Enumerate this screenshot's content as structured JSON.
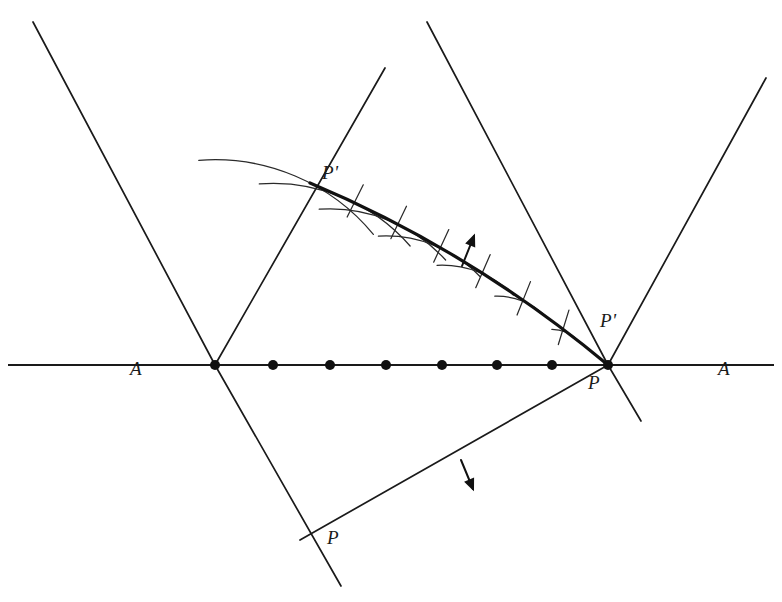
{
  "figure": {
    "width": 782,
    "height": 602,
    "background_color": "#ffffff",
    "stroke_color": "#1a1a1a"
  },
  "labels": {
    "axis_left": "A",
    "axis_right": "A",
    "point_upper_p_prime": "P'",
    "point_right_p_prime": "P'",
    "point_right_p": "P",
    "point_lower_p": "P"
  },
  "geometry": {
    "horizontal_axis": {
      "x1": 8,
      "y1": 365,
      "x2": 774,
      "y2": 365
    },
    "left_vertex": {
      "x": 215,
      "y": 365
    },
    "right_vertex": {
      "x": 608,
      "y": 365
    },
    "source_points": [
      {
        "x": 215,
        "y": 365
      },
      {
        "x": 273,
        "y": 365
      },
      {
        "x": 330,
        "y": 365
      },
      {
        "x": 386,
        "y": 365
      },
      {
        "x": 442,
        "y": 365
      },
      {
        "x": 497,
        "y": 365
      },
      {
        "x": 552,
        "y": 365
      },
      {
        "x": 608,
        "y": 365
      }
    ],
    "dot_radius": 5,
    "straight_lines": [
      {
        "name": "upper-left-ray",
        "x1": 33,
        "y1": 22,
        "x2": 215,
        "y2": 365
      },
      {
        "name": "left-vertex-up-right-ray",
        "x1": 215,
        "y1": 365,
        "x2": 385,
        "y2": 68
      },
      {
        "name": "left-vertex-down-right-ray",
        "x1": 215,
        "y1": 365,
        "x2": 341,
        "y2": 586
      },
      {
        "name": "right-vertex-up-left-ray",
        "x1": 608,
        "y1": 365,
        "x2": 427,
        "y2": 22
      },
      {
        "name": "right-vertex-up-right-ray",
        "x1": 608,
        "y1": 365,
        "x2": 766,
        "y2": 78
      },
      {
        "name": "right-vertex-down-right-ray",
        "x1": 608,
        "y1": 365,
        "x2": 641,
        "y2": 421
      },
      {
        "name": "right-vertex-down-left-ray",
        "x1": 608,
        "y1": 365,
        "x2": 300,
        "y2": 540
      }
    ],
    "envelope_curve": {
      "name": "bold-envelope",
      "from": {
        "x": 310,
        "y": 183
      },
      "control": {
        "x": 470,
        "y": 250
      },
      "to": {
        "x": 608,
        "y": 365
      },
      "stroke_width": 3.2
    },
    "wavelet_arcs_count": 7,
    "tangent_ticks_count": 6,
    "arrows": [
      {
        "name": "upward-propagation-arrow",
        "x1": 462,
        "y1": 266,
        "x2": 474,
        "y2": 236
      },
      {
        "name": "downward-propagation-arrow",
        "x1": 461,
        "y1": 460,
        "x2": 473,
        "y2": 489
      }
    ]
  },
  "label_positions": {
    "axis_left": {
      "x": 130,
      "y": 358
    },
    "axis_right": {
      "x": 718,
      "y": 358
    },
    "point_upper_p_prime": {
      "x": 322,
      "y": 162
    },
    "point_right_p_prime": {
      "x": 600,
      "y": 310
    },
    "point_right_p": {
      "x": 588,
      "y": 372
    },
    "point_lower_p": {
      "x": 327,
      "y": 527
    }
  }
}
